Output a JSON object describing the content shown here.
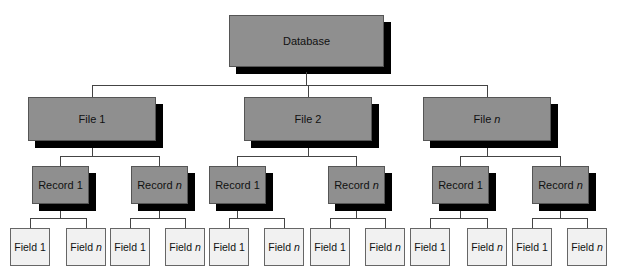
{
  "diagram": {
    "type": "hierarchy",
    "root": {
      "label": "Database"
    },
    "files": [
      {
        "label": "File 1",
        "base": "File",
        "suffix": "1",
        "italic": false,
        "records": [
          {
            "base": "Record",
            "suffix": "1",
            "italic": false,
            "fields": [
              {
                "base": "Field",
                "suffix": "1",
                "italic": false
              },
              {
                "base": "Field",
                "suffix": "n",
                "italic": true
              }
            ]
          },
          {
            "base": "Record",
            "suffix": "n",
            "italic": true,
            "fields": [
              {
                "base": "Field",
                "suffix": "1",
                "italic": false
              },
              {
                "base": "Field",
                "suffix": "n",
                "italic": true
              }
            ]
          }
        ]
      },
      {
        "label": "File 2",
        "base": "File",
        "suffix": "2",
        "italic": false,
        "records": [
          {
            "base": "Record",
            "suffix": "1",
            "italic": false,
            "fields": [
              {
                "base": "Field",
                "suffix": "1",
                "italic": false
              },
              {
                "base": "Field",
                "suffix": "n",
                "italic": true
              }
            ]
          },
          {
            "base": "Record",
            "suffix": "n",
            "italic": true,
            "fields": [
              {
                "base": "Field",
                "suffix": "1",
                "italic": false
              },
              {
                "base": "Field",
                "suffix": "n",
                "italic": true
              }
            ]
          }
        ]
      },
      {
        "label": "File n",
        "base": "File",
        "suffix": "n",
        "italic": true,
        "records": [
          {
            "base": "Record",
            "suffix": "1",
            "italic": false,
            "fields": [
              {
                "base": "Field",
                "suffix": "1",
                "italic": false
              },
              {
                "base": "Field",
                "suffix": "n",
                "italic": true
              }
            ]
          },
          {
            "base": "Record",
            "suffix": "n",
            "italic": true,
            "fields": [
              {
                "base": "Field",
                "suffix": "1",
                "italic": false
              },
              {
                "base": "Field",
                "suffix": "n",
                "italic": true
              }
            ]
          }
        ]
      }
    ]
  },
  "colors": {
    "dark_box": "#8f8f8f",
    "shadow": "#000000",
    "light_box": "#f1f1f1",
    "line": "#444444"
  }
}
